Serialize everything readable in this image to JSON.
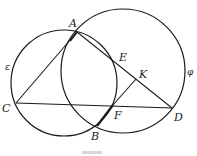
{
  "figure": {
    "type": "geometry-diagram",
    "circles": [
      {
        "name": "ε",
        "label": "ε",
        "cx": 64,
        "cy": 83,
        "r": 53
      },
      {
        "name": "φ",
        "label": "φ",
        "cx": 123,
        "cy": 71,
        "r": 62
      }
    ],
    "points": {
      "A": {
        "label": "A",
        "x": 77,
        "y": 32
      },
      "C": {
        "label": "C",
        "x": 16,
        "y": 103
      },
      "D": {
        "label": "D",
        "x": 172,
        "y": 108
      },
      "B": {
        "label": "B",
        "x": 97,
        "y": 126
      },
      "F": {
        "label": "F",
        "x": 113,
        "y": 105
      },
      "E": {
        "label": "E",
        "x": 119,
        "y": 57
      },
      "K": {
        "label": "K",
        "x": 136,
        "y": 79
      }
    },
    "segments": [
      "AC",
      "AD",
      "CD",
      "FK",
      "BF"
    ],
    "bold_segment": "BF",
    "caption": ""
  }
}
